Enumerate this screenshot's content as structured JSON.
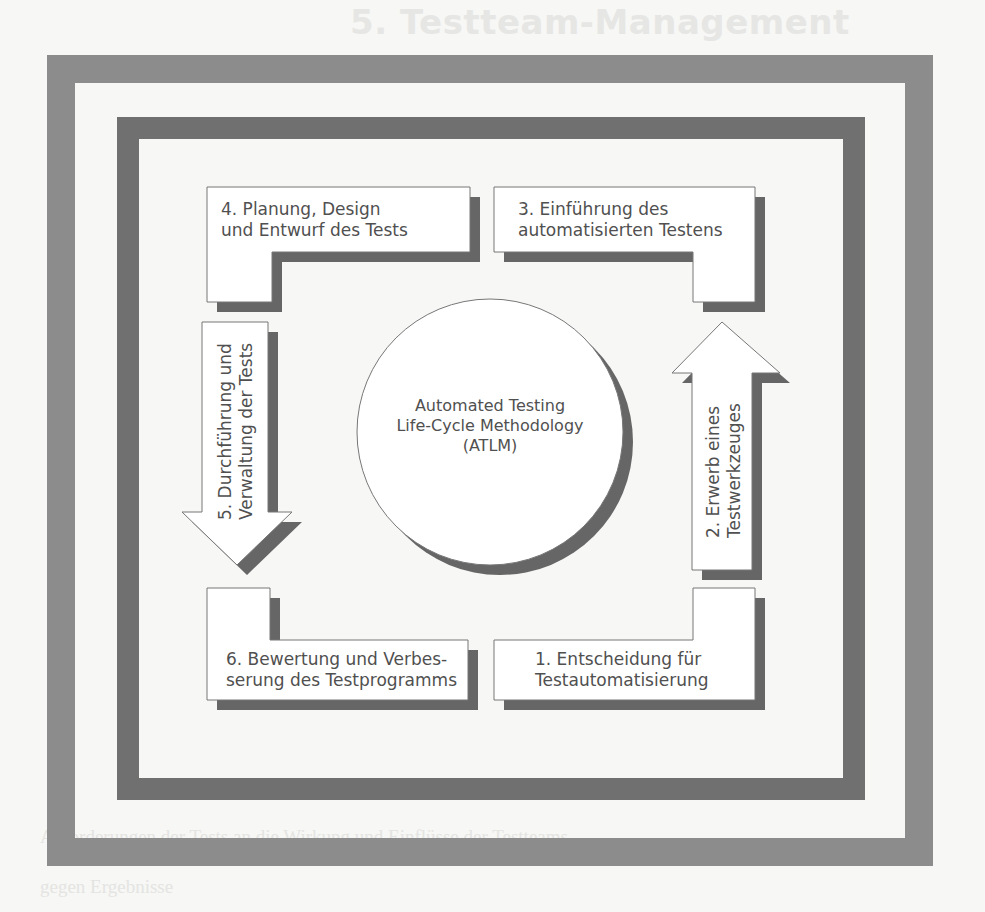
{
  "page": {
    "title": "5. Testteam-Management",
    "bleed_through_lines": [
      "Wenn man den zwei Zwecken folgen Gedanken nachgeht, soll ein Rahmen",
      "Kontrolle durch das Testteam als ein Aufbau der Wirkung der Organisation",
      "die Verteilung in der Testphase unterschiedlicher Verfahren in der",
      "Anforderungen der Tests an die Wirkung und Einflüsse der Testteams",
      "gegen Ergebnisse"
    ]
  },
  "diagram": {
    "center": {
      "line1": "Automated Testing",
      "line2": "Life-Cycle Methodology",
      "line3": "(ATLM)"
    },
    "steps": [
      {
        "id": 1,
        "line1": "1. Entscheidung für",
        "line2": "Testautomatisierung",
        "position": "bottom-right",
        "shape": "l-box"
      },
      {
        "id": 2,
        "line1": "2. Erwerb eines",
        "line2": "Testwerkzeuges",
        "position": "right",
        "shape": "arrow-up"
      },
      {
        "id": 3,
        "line1": "3. Einführung des",
        "line2": "automatisierten Testens",
        "position": "top-right",
        "shape": "l-box"
      },
      {
        "id": 4,
        "line1": "4. Planung, Design",
        "line2": "und Entwurf des Tests",
        "position": "top-left",
        "shape": "l-box"
      },
      {
        "id": 5,
        "line1": "5. Durchführung und",
        "line2": "Verwaltung der Tests",
        "position": "left",
        "shape": "arrow-down"
      },
      {
        "id": 6,
        "line1": "6. Bewertung und  Verbes-",
        "line2": "serung des Testprogramms",
        "position": "bottom-left",
        "shape": "l-box"
      }
    ]
  },
  "colors": {
    "outer_frame": "#8c8c8c",
    "inner_frame": "#707070",
    "shadow": "#666666",
    "outline": "#777777",
    "fill": "#ffffff",
    "text": "#505050"
  }
}
